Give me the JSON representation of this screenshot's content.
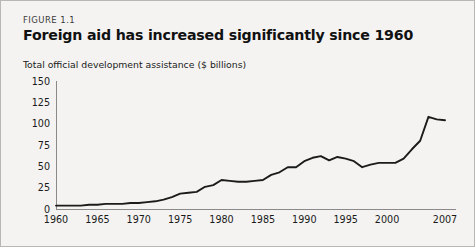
{
  "figure": {
    "label": "FIGURE 1.1",
    "title": "Foreign aid has increased significantly since 1960",
    "subtitle": "Total official development assistance ($ billions)"
  },
  "colors": {
    "card_background": "#f4f3f1",
    "card_border": "#b9b7b3",
    "line": "#1b1b1b",
    "axis": "#8a8a8a",
    "text": "#1a1a1a",
    "title": "#111111"
  },
  "chart_data": {
    "type": "line",
    "title": "Foreign aid has increased significantly since 1960",
    "subtitle": "Total official development assistance ($ billions)",
    "xlabel": "",
    "ylabel": "Total official development assistance ($ billions)",
    "xlim": [
      1960,
      2007
    ],
    "ylim": [
      0,
      150
    ],
    "grid": false,
    "legend": "none",
    "yticks": [
      0,
      25,
      50,
      75,
      100,
      125,
      150
    ],
    "ytick_labels": [
      "0",
      "25",
      "50",
      "75",
      "100",
      "125",
      "150"
    ],
    "xticks": [
      1960,
      1965,
      1970,
      1975,
      1980,
      1985,
      1990,
      1995,
      2000,
      2007
    ],
    "xtick_labels": [
      "1960",
      "1965",
      "1970",
      "1975",
      "1980",
      "1985",
      "1990",
      "1995",
      "2000",
      "2007"
    ],
    "series": [
      {
        "name": "Total official development assistance",
        "x": [
          1960,
          1961,
          1962,
          1963,
          1964,
          1965,
          1966,
          1967,
          1968,
          1969,
          1970,
          1971,
          1972,
          1973,
          1974,
          1975,
          1976,
          1977,
          1978,
          1979,
          1980,
          1981,
          1982,
          1983,
          1984,
          1985,
          1986,
          1987,
          1988,
          1989,
          1990,
          1991,
          1992,
          1993,
          1994,
          1995,
          1996,
          1997,
          1998,
          1999,
          2000,
          2001,
          2002,
          2003,
          2004,
          2005,
          2006,
          2007
        ],
        "values": [
          4,
          4,
          4,
          4,
          5,
          5,
          6,
          6,
          6,
          7,
          7,
          8,
          9,
          11,
          14,
          18,
          19,
          20,
          26,
          28,
          34,
          33,
          32,
          32,
          33,
          34,
          40,
          43,
          49,
          49,
          56,
          60,
          62,
          57,
          61,
          59,
          56,
          49,
          52,
          54,
          54,
          54,
          59,
          70,
          80,
          108,
          105,
          104
        ]
      }
    ]
  }
}
